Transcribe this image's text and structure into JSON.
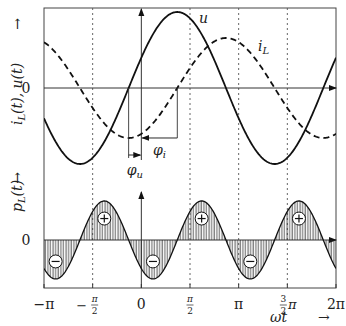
{
  "figure": {
    "width": 346,
    "height": 326,
    "frame": {
      "left": 44,
      "right": 336,
      "top": 8,
      "bottom": 288
    },
    "colors": {
      "line": "#111111",
      "axis": "#333333",
      "grid": "#555555",
      "hatch": "#222222",
      "text": "#222222"
    }
  },
  "upper_panel": {
    "ylabel": "i_L(t), u(t)",
    "ylabel_parts": {
      "i": "i",
      "sub": "L",
      "rest": "(t), u(t)"
    },
    "arrow_label": "→",
    "zero_label": "0",
    "zero_y": 88,
    "curves": [
      {
        "name": "u",
        "label": "u",
        "style": "solid",
        "amplitude": 76,
        "phase": 0.41
      },
      {
        "name": "i_L",
        "label_main": "i",
        "label_sub": "L",
        "style": "dashed",
        "amplitude": 50,
        "phase": -1.16
      }
    ],
    "phase_labels": {
      "phi_u": "φu",
      "phi_u_main": "φ",
      "phi_u_sub": "u",
      "phi_i_main": "φ",
      "phi_i_sub": "i"
    }
  },
  "lower_panel": {
    "ylabel": "p_L(t)",
    "ylabel_parts": {
      "p": "p",
      "sub": "L",
      "rest": "(t)"
    },
    "arrow_label": "→",
    "zero_label": "0",
    "zero_y": 240,
    "amplitude": 39,
    "signs": {
      "plus": "+",
      "minus": "−"
    }
  },
  "x_axis": {
    "label_main": "ωt",
    "arrow": "→",
    "ticks": [
      {
        "value": -3.14159,
        "label": "−π"
      },
      {
        "value": -1.5708,
        "label": "−π/2"
      },
      {
        "value": 0,
        "label": "0"
      },
      {
        "value": 1.5708,
        "label": "π/2"
      },
      {
        "value": 3.14159,
        "label": "π"
      },
      {
        "value": 4.71239,
        "label": "3/2π"
      },
      {
        "value": 6.28319,
        "label": "2π"
      }
    ]
  },
  "chart_data": {
    "type": "line",
    "title": "",
    "xlabel": "ωt",
    "x_range": [
      -3.14159,
      6.28319
    ],
    "series": [
      {
        "name": "u(t)",
        "formula": "U·sin(ωt + φu)",
        "phase_rad": 0.41,
        "relative_amplitude": 1.0,
        "style": "solid"
      },
      {
        "name": "i_L(t)",
        "formula": "I·sin(ωt + φu − π/2)",
        "phase_rad": -1.16,
        "relative_amplitude": 0.66,
        "style": "dashed"
      },
      {
        "name": "p_L(t)",
        "formula": "u·i_L = −½UI·sin(2(ωt + φu))",
        "style": "solid, hatched area",
        "sign_regions": [
          "−",
          "+",
          "−",
          "+",
          "−",
          "+"
        ]
      }
    ],
    "annotations": [
      "u",
      "i_L",
      "φu",
      "φi",
      "+",
      "−"
    ],
    "ylabels": [
      "i_L(t), u(t)",
      "p_L(t)"
    ]
  }
}
